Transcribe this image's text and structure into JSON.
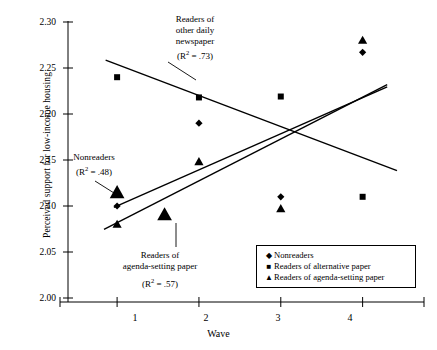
{
  "chart_data": {
    "type": "scatter",
    "title": "",
    "xlabel": "Wave",
    "ylabel": "Perceived support for low-income housing",
    "xlim": [
      0.4,
      4.75
    ],
    "ylim": [
      2.0,
      2.3
    ],
    "x": [
      1,
      2,
      3,
      4
    ],
    "xticklabels": [
      "1",
      "2",
      "3",
      "4"
    ],
    "yticklabels": [
      "2.00",
      "2.05",
      "2.10",
      "2.15",
      "2.20",
      "2.25",
      "2.30"
    ],
    "yticks": [
      2.0,
      2.05,
      2.1,
      2.15,
      2.2,
      2.25,
      2.3
    ],
    "grid": false,
    "legend_position": "bottom-right",
    "series": [
      {
        "name": "Nonreaders",
        "marker": "diamond",
        "values": [
          2.1,
          2.19,
          2.11,
          2.267
        ]
      },
      {
        "name": "Readers of alternative paper",
        "marker": "square",
        "values": [
          2.24,
          2.218,
          2.219,
          2.11
        ]
      },
      {
        "name": "Readers of agenda-setting paper",
        "marker": "triangle",
        "values": [
          2.08,
          2.148,
          2.097,
          2.28
        ]
      }
    ],
    "trendlines": [
      {
        "name": "Readers of other daily newspaper",
        "r_squared": ".73",
        "direction": "decreasing",
        "x0": 0.86,
        "y0": 2.2585,
        "x1": 4.42,
        "y1": 2.1385
      },
      {
        "name": "Nonreaders",
        "r_squared": ".48",
        "direction": "increasing",
        "x0": 0.96,
        "y0": 2.0985,
        "x1": 4.3,
        "y1": 2.2295
      },
      {
        "name": "Readers of agenda-setting paper",
        "r_squared": ".57",
        "direction": "increasing",
        "x0": 0.84,
        "y0": 2.0745,
        "x1": 4.3,
        "y1": 2.232
      }
    ],
    "annotations": [
      {
        "id": "other-daily",
        "lines": [
          "Readers of",
          "other daily",
          "newspaper"
        ],
        "r2_text": "= .73",
        "leader": true
      },
      {
        "id": "nonreaders",
        "lines": [
          "Nonreaders"
        ],
        "r2_text": "= .48",
        "leader": true
      },
      {
        "id": "agenda",
        "lines": [
          "Readers of",
          "agenda-setting paper"
        ],
        "r2_text": "= .57",
        "leader": true
      }
    ],
    "legend": [
      {
        "marker": "diamond",
        "label": "Nonreaders"
      },
      {
        "marker": "square",
        "label": "Readers of alternative paper"
      },
      {
        "marker": "triangle",
        "label": "Readers of agenda-setting paper"
      }
    ]
  },
  "axes": {
    "y_title": "Perceived support for low-income housing",
    "x_title": "Wave",
    "y_labels": [
      "2.30",
      "2.25",
      "2.20",
      "2.15",
      "2.10",
      "2.05",
      "2.00"
    ],
    "x_labels": [
      "1",
      "2",
      "3",
      "4"
    ]
  },
  "annotations": {
    "other_daily": {
      "line1": "Readers of",
      "line2": "other daily",
      "line3": "newspaper",
      "r2_prefix": "(R",
      "r2_sup": "2",
      "r2_value": " = .73)"
    },
    "nonreaders": {
      "line1": "Nonreaders",
      "r2_prefix": "(R",
      "r2_sup": "2",
      "r2_value": " = .48)"
    },
    "agenda": {
      "line1": "Readers of",
      "line2": "agenda-setting paper",
      "r2_prefix": "(R",
      "r2_sup": "2",
      "r2_value": " = .57)"
    }
  },
  "legend": {
    "item0_mark": "◆",
    "item0_label": "Nonreaders",
    "item1_mark": "■",
    "item1_label": "Readers of alternative paper",
    "item2_mark": "▲",
    "item2_label": "Readers of agenda-setting paper"
  },
  "colors": {
    "ink": "#000000",
    "background": "#ffffff"
  }
}
